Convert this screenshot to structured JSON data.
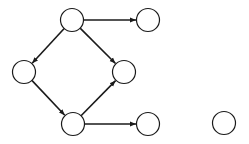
{
  "diagram": {
    "type": "directed-graph",
    "node_radius": 11.5,
    "colors": {
      "stroke": "#1a1a1a",
      "fill": "#ffffff",
      "background": "#ffffff"
    },
    "nodes": [
      {
        "id": "A",
        "x": 72,
        "y": 20
      },
      {
        "id": "B",
        "x": 148,
        "y": 20
      },
      {
        "id": "C",
        "x": 24,
        "y": 72
      },
      {
        "id": "D",
        "x": 124,
        "y": 72
      },
      {
        "id": "E",
        "x": 73,
        "y": 124
      },
      {
        "id": "F",
        "x": 148,
        "y": 124
      },
      {
        "id": "G",
        "x": 224,
        "y": 123
      }
    ],
    "edges": [
      {
        "from": "A",
        "to": "B"
      },
      {
        "from": "A",
        "to": "C"
      },
      {
        "from": "A",
        "to": "D"
      },
      {
        "from": "C",
        "to": "E"
      },
      {
        "from": "E",
        "to": "D"
      },
      {
        "from": "E",
        "to": "F"
      }
    ]
  }
}
